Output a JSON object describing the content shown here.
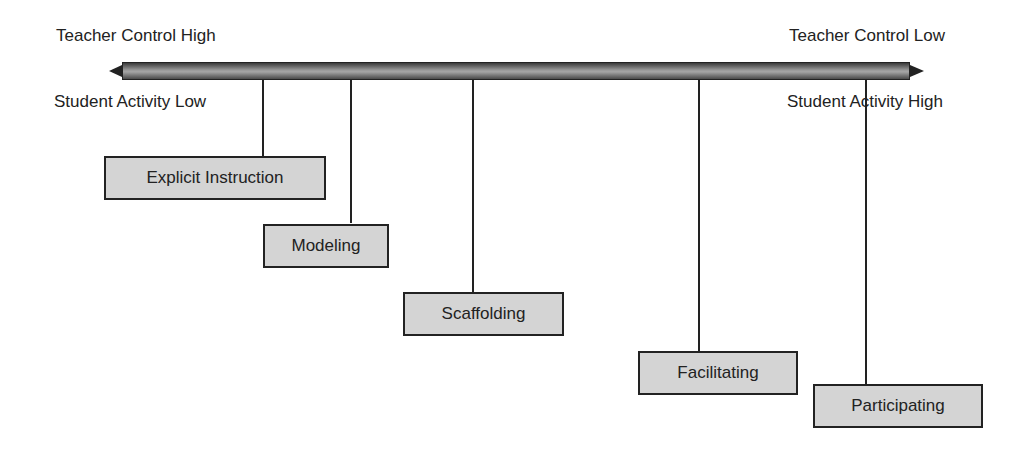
{
  "diagram": {
    "type": "continuum",
    "axis": {
      "top_left_label": "Teacher Control High",
      "top_right_label": "Teacher Control Low",
      "bottom_left_label": "Student Activity Low",
      "bottom_right_label": "Student Activity High",
      "direction": "bidirectional"
    },
    "stages": [
      {
        "label": "Explicit Instruction"
      },
      {
        "label": "Modeling"
      },
      {
        "label": "Scaffolding"
      },
      {
        "label": "Facilitating"
      },
      {
        "label": "Participating"
      }
    ]
  }
}
